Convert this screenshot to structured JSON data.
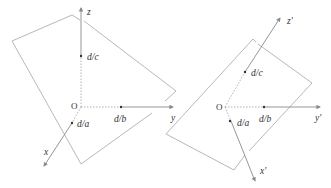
{
  "diagram": {
    "left": {
      "origin_label": "O",
      "axes": {
        "x": "x",
        "y": "y",
        "z": "z"
      },
      "intercepts": {
        "x": "d/a",
        "y": "d/b",
        "z": "d/c"
      }
    },
    "right": {
      "origin_label": "O",
      "axes": {
        "x": "x'",
        "y": "y'",
        "z": "z'"
      },
      "intercepts": {
        "x": "d/a",
        "y": "d/b",
        "z": "d/c"
      }
    },
    "colors": {
      "plane": "#b8b8b8",
      "axis": "#8a8a8a",
      "text": "#333333"
    }
  }
}
